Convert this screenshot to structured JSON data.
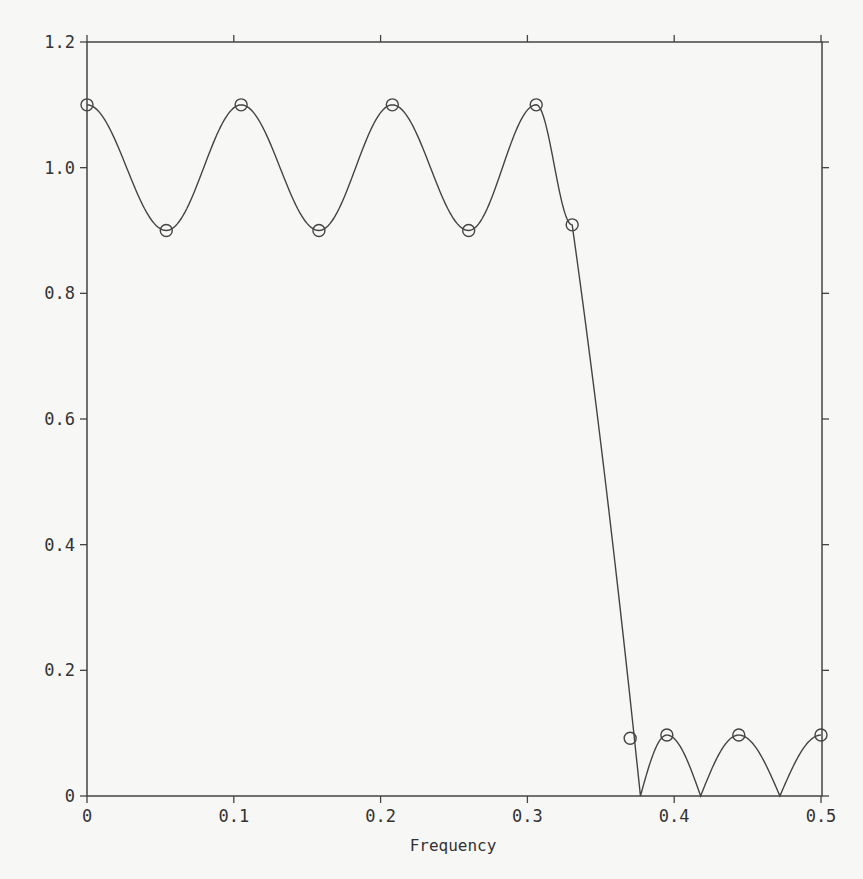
{
  "chart_data": {
    "type": "line",
    "title": "",
    "xlabel": "Frequency",
    "ylabel": "",
    "xlim": [
      0,
      0.5
    ],
    "ylim": [
      0,
      1.2
    ],
    "grid": false,
    "legend": null,
    "x_ticks": [
      0,
      0.1,
      0.2,
      0.3,
      0.4,
      0.5
    ],
    "x_tick_labels": [
      "0",
      "0.1",
      "0.2",
      "0.3",
      "0.4",
      "0.5"
    ],
    "y_ticks": [
      0,
      0.2,
      0.4,
      0.6,
      0.8,
      1.0,
      1.2
    ],
    "y_tick_labels": [
      "0",
      "0.2",
      "0.4",
      "0.6",
      "0.8",
      "1.0",
      "1.2"
    ],
    "series": [
      {
        "name": "magnitude response",
        "style": "line",
        "extrema": [
          {
            "x": 0.0,
            "y": 1.1
          },
          {
            "x": 0.054,
            "y": 0.9
          },
          {
            "x": 0.105,
            "y": 1.1
          },
          {
            "x": 0.158,
            "y": 0.9
          },
          {
            "x": 0.208,
            "y": 1.1
          },
          {
            "x": 0.26,
            "y": 0.9
          },
          {
            "x": 0.306,
            "y": 1.1
          },
          {
            "x": 0.3305,
            "y": 0.909
          },
          {
            "x": 0.377,
            "y": 0.0
          },
          {
            "x": 0.395,
            "y": 0.097
          },
          {
            "x": 0.418,
            "y": 0.0
          },
          {
            "x": 0.444,
            "y": 0.097
          },
          {
            "x": 0.472,
            "y": 0.0
          },
          {
            "x": 0.5,
            "y": 0.097
          }
        ]
      },
      {
        "name": "extremal points",
        "style": "circle-markers",
        "x": [
          0.0,
          0.054,
          0.105,
          0.158,
          0.208,
          0.26,
          0.306,
          0.3305,
          0.37,
          0.395,
          0.444,
          0.5
        ],
        "y": [
          1.1,
          0.9,
          1.1,
          0.9,
          1.1,
          0.9,
          1.1,
          0.909,
          0.092,
          0.097,
          0.097,
          0.097
        ]
      }
    ]
  }
}
